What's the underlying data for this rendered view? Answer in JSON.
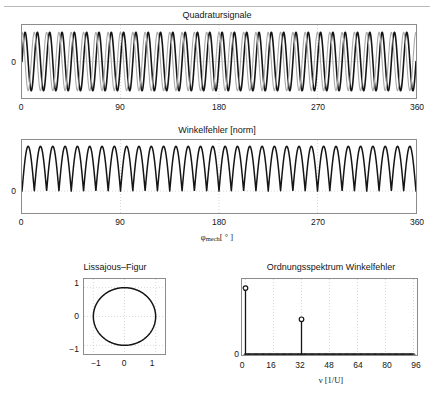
{
  "figure": {
    "panels": [
      "quadrature",
      "angle_error",
      "lissajous",
      "spectrum"
    ]
  },
  "chart_data": [
    {
      "id": "quadrature",
      "type": "line",
      "title": "Quadratursignale",
      "xlabel": "",
      "ylabel": "",
      "xlim": [
        0,
        360
      ],
      "ylim": [
        -1.25,
        1.25
      ],
      "xticks": [
        0,
        90,
        180,
        270,
        360
      ],
      "xticklabels": [
        "0",
        "90",
        "180",
        "270",
        "360"
      ],
      "yticks": [
        0
      ],
      "yticklabels": [
        "0"
      ],
      "grid": true,
      "series": [
        {
          "name": "sin-channel",
          "color": "#151515",
          "linewidth": 1.6,
          "waveform": "sine",
          "cycles": 32,
          "amplitude": 1.0,
          "phase_deg": 0
        },
        {
          "name": "cos-channel",
          "color": "#a9a9a9",
          "linewidth": 1.1,
          "waveform": "sine",
          "cycles": 32,
          "amplitude": 1.0,
          "phase_deg": 90
        }
      ]
    },
    {
      "id": "angle_error",
      "type": "line",
      "title": "Winkelfehler [norm]",
      "xlabel_parts": {
        "symbol": "φ",
        "subscript": "mech",
        "unit": "[ ° ]"
      },
      "ylabel": "",
      "xlim": [
        0,
        360
      ],
      "ylim": [
        -0.45,
        1.05
      ],
      "xticks": [
        0,
        90,
        180,
        270,
        360
      ],
      "xticklabels": [
        "0",
        "90",
        "180",
        "270",
        "360"
      ],
      "yticks": [
        0
      ],
      "yticklabels": [
        "0"
      ],
      "grid": true,
      "series": [
        {
          "name": "winkelfehler",
          "color": "#151515",
          "linewidth": 1.5,
          "waveform": "rectified-sine",
          "cycles": 32,
          "amplitude": 0.92,
          "offset": 0.0
        }
      ]
    },
    {
      "id": "lissajous",
      "type": "line",
      "title": "Lissajous–Figur",
      "xlabel": "",
      "ylabel": "",
      "xlim": [
        -1.3,
        1.3
      ],
      "ylim": [
        -1.3,
        1.3
      ],
      "xticks": [
        -1,
        0,
        1
      ],
      "xticklabels": [
        "−1",
        "0",
        "1"
      ],
      "yticks": [
        -1,
        0,
        1
      ],
      "yticklabels": [
        "−1",
        "0",
        "1"
      ],
      "grid": true,
      "series": [
        {
          "name": "lissajous-curve",
          "color": "#151515",
          "linewidth": 1.5,
          "shape": "circle",
          "radius_x": 1.0,
          "radius_y": 1.0,
          "center": [
            0.0,
            0.0
          ]
        }
      ]
    },
    {
      "id": "spectrum",
      "type": "bar",
      "title": "Ordnungsspektrum Winkelfehler",
      "xlabel_parts": {
        "symbol": "ν",
        "unit": "[1/U]"
      },
      "ylabel": "",
      "xlim": [
        -2,
        98
      ],
      "ylim": [
        0,
        1.0
      ],
      "xticks": [
        0,
        16,
        32,
        48,
        64,
        80,
        96
      ],
      "xticklabels": [
        "0",
        "16",
        "32",
        "48",
        "64",
        "80",
        "96"
      ],
      "yticks": [
        0
      ],
      "yticklabels": [
        "0"
      ],
      "grid": true,
      "stem_marker": "circle",
      "orders": [
        0,
        32
      ],
      "values": [
        0.88,
        0.47
      ],
      "baseline_order_range": [
        0,
        96
      ],
      "baseline_value": 0.0
    }
  ]
}
